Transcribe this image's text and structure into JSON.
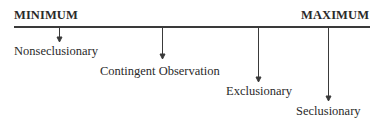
{
  "diagram": {
    "type": "continuum",
    "left_end": "MINIMUM",
    "right_end": "MAXIMUM",
    "items": [
      {
        "label": "Nonseclusionary",
        "order": 1
      },
      {
        "label": "Contingent Observation",
        "order": 2
      },
      {
        "label": "Exclusionary",
        "order": 3
      },
      {
        "label": "Seclusionary",
        "order": 4
      }
    ]
  }
}
